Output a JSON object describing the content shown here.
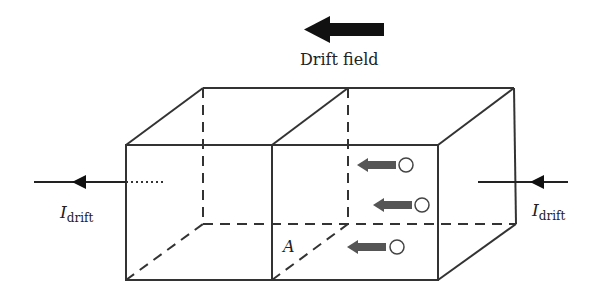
{
  "diagram": {
    "title": "Drift field",
    "current_label_main": "I",
    "current_label_sub": "drift",
    "area_label": "A",
    "colors": {
      "line": "#333333",
      "field_arrow": "#111111",
      "particle_arrow": "#555555",
      "particle": "#ffffff"
    },
    "elements": {
      "drift_field_arrow": "left-pointing thick arrow",
      "left_current_arrow": "left-pointing arrow into left side",
      "right_current_arrow": "left-pointing arrow into right side",
      "particles": [
        {
          "id": 1,
          "direction": "left"
        },
        {
          "id": 2,
          "direction": "left"
        },
        {
          "id": 3,
          "direction": "left"
        }
      ]
    }
  }
}
